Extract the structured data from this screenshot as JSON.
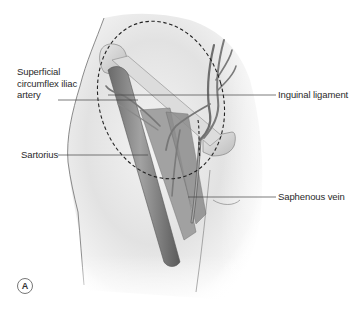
{
  "figure": {
    "panel_label": "A",
    "colors": {
      "skin_light": "#f2f2f2",
      "skin_shadow": "#c9c9c9",
      "muscle": "#8a8a8a",
      "muscle_dark": "#5e5e5e",
      "vessel": "#7a7a7a",
      "bone": "#d8d8d8",
      "leader_line": "#444444",
      "dashed_outline": "#222222"
    }
  },
  "labels": {
    "superficial_circumflex_iliac_artery": "Superficial circumflex iliac artery",
    "inguinal_ligament": "Inguinal ligament",
    "sartorius": "Sartorius",
    "saphenous_vein": "Saphenous vein"
  }
}
